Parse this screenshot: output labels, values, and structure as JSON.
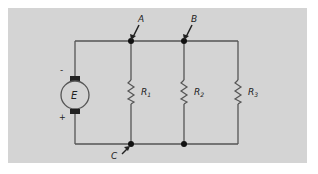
{
  "diagram": {
    "type": "parallel-circuit",
    "background_color": "#d4d4d4",
    "wire_color": "#555555",
    "source": {
      "symbol": "E",
      "negative_terminal": "-",
      "positive_terminal": "+"
    },
    "nodes": [
      {
        "label": "A"
      },
      {
        "label": "B"
      },
      {
        "label": "C"
      }
    ],
    "resistors": [
      {
        "letter": "R",
        "subscript": "1"
      },
      {
        "letter": "R",
        "subscript": "2"
      },
      {
        "letter": "R",
        "subscript": "3"
      }
    ]
  }
}
